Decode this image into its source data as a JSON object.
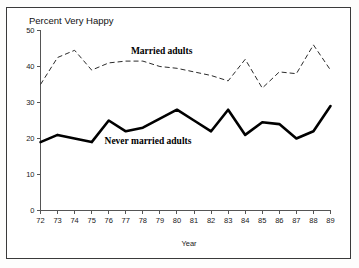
{
  "figure": {
    "border_color": "#3a3a3a",
    "background": "#ffffff"
  },
  "chart_data": {
    "type": "line",
    "title": "Percent Very Happy",
    "xlabel": "Year",
    "ylabel": "",
    "x": [
      72,
      73,
      74,
      75,
      76,
      77,
      78,
      79,
      80,
      81,
      82,
      83,
      84,
      85,
      86,
      87,
      88,
      89
    ],
    "xtick_labels": [
      "72",
      "73",
      "74",
      "75",
      "76",
      "77",
      "78",
      "79",
      "80",
      "81",
      "82",
      "83",
      "84",
      "85",
      "86",
      "87",
      "88",
      "89"
    ],
    "ytick_labels": [
      "0",
      "10",
      "20",
      "30",
      "40",
      "50"
    ],
    "yticks": [
      0,
      10,
      20,
      30,
      40,
      50
    ],
    "ylim": [
      0,
      50
    ],
    "xlim": [
      72,
      89
    ],
    "grid": false,
    "legend_position": "inline-annotations",
    "series": [
      {
        "name": "Married adults",
        "style": "dashed",
        "color": "#2b2b2b",
        "label_x": 79.1,
        "label_y": 43.6,
        "values": [
          35,
          42.5,
          44.5,
          39,
          41,
          41.5,
          41.5,
          40,
          39.5,
          38.5,
          37.5,
          36,
          42,
          34,
          38.5,
          38,
          46,
          39
        ]
      },
      {
        "name": "Never married adults",
        "style": "solid",
        "color": "#000000",
        "label_x": 78.3,
        "label_y": 18.6,
        "values": [
          19,
          21,
          20,
          19,
          25,
          22,
          23,
          25.5,
          28,
          25,
          22,
          28,
          21,
          24.5,
          24,
          20,
          22,
          29
        ]
      }
    ]
  }
}
